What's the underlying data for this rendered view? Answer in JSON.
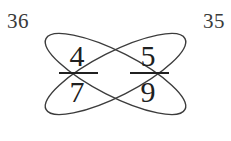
{
  "canvas": {
    "width": 231,
    "height": 141,
    "background": "#ffffff"
  },
  "colors": {
    "stroke": "#3c3c3c",
    "digit": "#202020",
    "label": "#3a3a3a",
    "background": "#ffffff"
  },
  "corner_labels": {
    "left": "36",
    "right": "35"
  },
  "fractions": [
    {
      "position": "left",
      "numerator": "4",
      "denominator": "7"
    },
    {
      "position": "right",
      "numerator": "5",
      "denominator": "9"
    }
  ],
  "digits": {
    "numerator_left": "4",
    "numerator_right": "5",
    "denominator_left": "7",
    "denominator_right": "9"
  },
  "geometry": {
    "ellipse_a": {
      "cx": 115.5,
      "cy": 74,
      "rx": 78,
      "ry": 22,
      "rotation_deg": -27,
      "description": "ellipse rising to the right"
    },
    "ellipse_b": {
      "cx": 115.5,
      "cy": 74,
      "rx": 78,
      "ry": 22,
      "rotation_deg": 27,
      "description": "ellipse falling to the right"
    },
    "fraction_bar_left": {
      "x1": 59,
      "x2": 98,
      "y": 73
    },
    "fraction_bar_right": {
      "x1": 130,
      "x2": 169,
      "y": 73
    },
    "stroke_width": 1.4
  },
  "cross_products": {
    "left_value": "36",
    "right_value": "35",
    "left_operation": "4 × 9",
    "right_operation": "5 × 7"
  }
}
